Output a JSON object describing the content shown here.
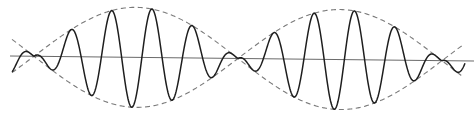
{
  "figure": {
    "title": "",
    "width": 474,
    "height": 117,
    "colors": {
      "background": "#ffffff",
      "carrier": "#1e1e1e",
      "envelope": "#7a7a7a",
      "axis": "#6a6a6a"
    },
    "axis": {
      "x1": 10,
      "y1": 56,
      "x2": 474,
      "y2": 61
    },
    "envelope": {
      "nodes_x": [
        34,
        238,
        442
      ],
      "amplitude_px": 50,
      "x_start": 12,
      "x_end": 462,
      "style": "dashed"
    },
    "carrier": {
      "x_start": 12,
      "x_end": 465,
      "period_px": 40.5,
      "phase_ref_x": 71,
      "cycles_per_lobe": 5
    },
    "labels": []
  }
}
